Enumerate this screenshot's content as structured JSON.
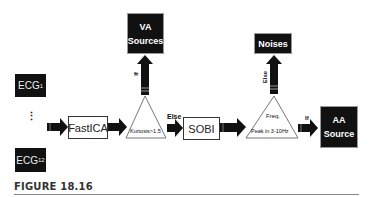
{
  "diagram": {
    "inputs": {
      "ecg_first": {
        "base": "ECG",
        "sub": "1"
      },
      "ecg_last": {
        "base": "ECG",
        "sub": "12"
      },
      "ellipsis": "⋮"
    },
    "stages": {
      "fastica": "FastICA",
      "sobi": "SOBI"
    },
    "decisions": {
      "kurtosis": {
        "condition": "Kurtosis>1.5",
        "if_label": "If",
        "else_label": "Else"
      },
      "frequency": {
        "line1": "Freq.",
        "line2": "Peak in 3-10Hz",
        "if_label": "If",
        "else_label": "Else"
      }
    },
    "outputs": {
      "va_sources": {
        "line1": "VA",
        "line2": "Sources"
      },
      "noises": {
        "line1": "Noises"
      },
      "aa_source": {
        "line1": "AA",
        "line2": "Source"
      }
    },
    "colors": {
      "box_dark": "#111111",
      "arrow": "#111111",
      "triangle_stroke": "#777777"
    }
  },
  "caption": {
    "figure_label": "FIGURE 18.16"
  }
}
